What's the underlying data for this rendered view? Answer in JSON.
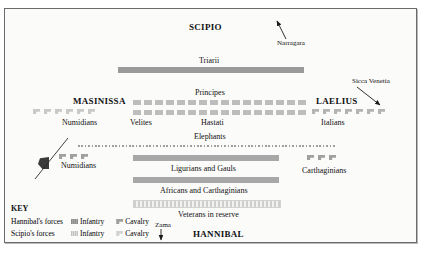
{
  "diagram": {
    "title_top": "SCIPIO",
    "title_bottom": "HANNIBAL",
    "roman": {
      "commander_center": "SCIPIO",
      "left_wing_commander": "MASINISSA",
      "right_wing_commander": "LAELIUS",
      "lines": [
        {
          "name": "Triarii",
          "type": "infantry-solid"
        },
        {
          "name": "Principes",
          "type": "infantry-maniples"
        },
        {
          "name": "Hastati",
          "type": "infantry-maniples"
        },
        {
          "name": "Velites",
          "type": "skirmishers"
        }
      ],
      "left_wing_unit": "Numidians",
      "right_wing_unit": "Italians",
      "left_wing_count": 6,
      "right_wing_count": 7
    },
    "carthaginian": {
      "commander_center": "HANNIBAL",
      "lines": [
        {
          "name": "Elephants",
          "type": "screen-dotted"
        },
        {
          "name": "Ligurians and Gauls",
          "type": "infantry-solid"
        },
        {
          "name": "Africans and Carthaginians",
          "type": "infantry-solid"
        },
        {
          "name": "Veterans in reserve",
          "type": "infantry-reserve"
        }
      ],
      "left_wing_unit": "Numidians",
      "right_wing_unit": "Carthaginians",
      "left_wing_count": 3,
      "right_wing_count": 3
    },
    "places": [
      {
        "label": "Narragara",
        "direction": "up"
      },
      {
        "label": "Sicca Venetia",
        "direction": "down-right"
      },
      {
        "label": "Zama",
        "direction": "down"
      }
    ],
    "key": {
      "title": "KEY",
      "rows": [
        {
          "force": "Hannibal's forces",
          "infantry": "Infantry",
          "cavalry": "Cavalry"
        },
        {
          "force": "Scipio's forces",
          "infantry": "Infantry",
          "cavalry": "Cavalry"
        }
      ]
    },
    "colors": {
      "hannibal_infantry": "#9a9a9a",
      "scipio_infantry": "#cfcfcd",
      "hannibal_cavalry": "#a0a09e",
      "scipio_cavalry": "#d3d3d1",
      "background": "#fbfbfa",
      "border": "#6a6a6a",
      "text": "#111111"
    }
  }
}
